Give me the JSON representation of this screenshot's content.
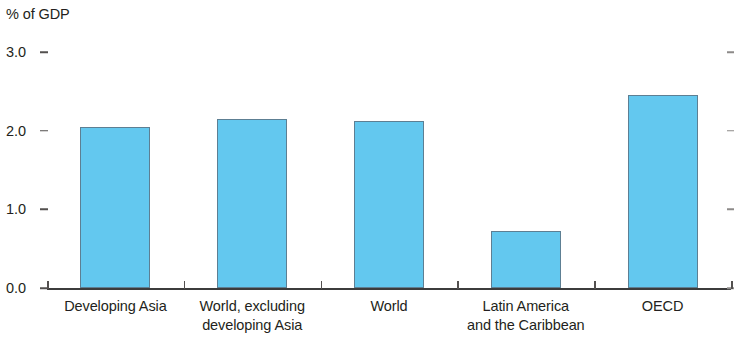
{
  "chart_data": {
    "type": "bar",
    "title": "",
    "subtitle": "",
    "ylabel": "% of GDP",
    "xlabel": "",
    "ylim": [
      0.0,
      3.0
    ],
    "ytick_labels": [
      "0.0",
      "1.0",
      "2.0",
      "3.0"
    ],
    "ytick_values": [
      0.0,
      1.0,
      2.0,
      3.0
    ],
    "grid": false,
    "legend": null,
    "bar_color": "#63c8ef",
    "bar_edge_color": "#5d7f93",
    "axis_color": "#3c3c3c",
    "categories": [
      "Developing Asia",
      "World, excluding developing Asia",
      "World",
      "Latin America and the Caribbean",
      "OECD"
    ],
    "category_label_lines": [
      [
        "Developing Asia"
      ],
      [
        "World, excluding",
        "developing Asia"
      ],
      [
        "World"
      ],
      [
        "Latin America",
        "and the Caribbean"
      ],
      [
        "OECD"
      ]
    ],
    "values": [
      2.05,
      2.15,
      2.12,
      0.73,
      2.45
    ]
  }
}
